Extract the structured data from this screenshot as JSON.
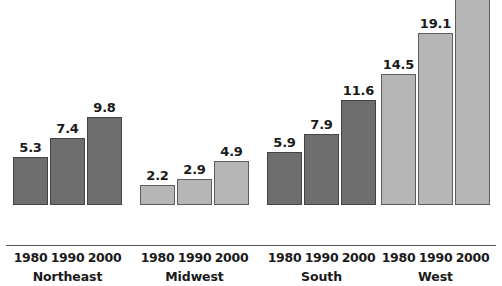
{
  "chart_data": {
    "type": "bar",
    "title": "",
    "subtitle": "",
    "xlabel": "",
    "ylabel": "",
    "ylim": [
      0,
      24.3
    ],
    "grid": false,
    "legend": "none",
    "categories": [
      "1980",
      "1990",
      "2000"
    ],
    "groups": [
      {
        "name": "Northeast",
        "color": "#6e6e6e",
        "bars": [
          {
            "category": "1980",
            "value": 5.3,
            "label": "5.3"
          },
          {
            "category": "1990",
            "value": 7.4,
            "label": "7.4"
          },
          {
            "category": "2000",
            "value": 9.8,
            "label": "9.8"
          }
        ]
      },
      {
        "name": "Midwest",
        "color": "#b6b6b6",
        "bars": [
          {
            "category": "1980",
            "value": 2.2,
            "label": "2.2"
          },
          {
            "category": "1990",
            "value": 2.9,
            "label": "2.9"
          },
          {
            "category": "2000",
            "value": 4.9,
            "label": "4.9"
          }
        ]
      },
      {
        "name": "South",
        "color": "#6e6e6e",
        "bars": [
          {
            "category": "1980",
            "value": 5.9,
            "label": "5.9"
          },
          {
            "category": "1990",
            "value": 7.9,
            "label": "7.9"
          },
          {
            "category": "2000",
            "value": 11.6,
            "label": "11.6"
          }
        ]
      },
      {
        "name": "West",
        "color": "#b6b6b6",
        "bars": [
          {
            "category": "1980",
            "value": 14.5,
            "label": "14.5"
          },
          {
            "category": "1990",
            "value": 19.1,
            "label": "19.1"
          },
          {
            "category": "2000",
            "value": 24.3,
            "label": "24.3"
          }
        ]
      }
    ]
  },
  "layout": {
    "baseline_y": 245,
    "px_per_unit": 9.03,
    "bar_width": 35,
    "bar_gap": 2,
    "group_left": [
      13,
      140,
      267,
      381
    ],
    "axis_color": "#555555",
    "background": "#ffffff",
    "dark_bar_color": "#6e6e6e",
    "light_bar_color": "#b6b6b6"
  }
}
